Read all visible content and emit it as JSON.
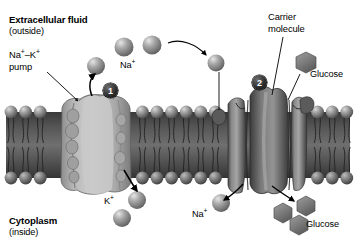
{
  "figure": {
    "type": "cell-membrane-transport-diagram",
    "background_color": "#ffffff",
    "palette": {
      "membrane_dark": "#3f3f3f",
      "membrane_mid": "#6e6e6e",
      "protein_light": "#b9b9b9",
      "protein_dark": "#6a6a6a",
      "sphere": "#8e8e8e",
      "glucose": "#7d7d7d",
      "text": "#000000",
      "badge": "#1a1a1a"
    }
  },
  "labels": {
    "extracellular_fluid": "Extracellular fluid",
    "extracellular_sub": "(outside)",
    "pump_line1": "Na⁻–K⁻ pump",
    "pump_name": "Na",
    "pump_sup1": "+",
    "pump_dash": "–K",
    "pump_sup2": "+",
    "pump_word": "pump",
    "na_top": "Na",
    "na_top_sup": "+",
    "carrier_line1": "Carrier",
    "carrier_line2": "molecule",
    "glucose_top": "Glucose",
    "k_bottom": "K",
    "k_bottom_sup": "+",
    "na_bottom": "Na",
    "na_bottom_sup": "+",
    "glucose_bottom": "Glucose",
    "cytoplasm": "Cytoplasm",
    "cytoplasm_sub": "(inside)"
  },
  "callouts": [
    {
      "number": "1",
      "name": "sodium-potassium-pump-callout"
    },
    {
      "number": "2",
      "name": "carrier-molecule-callout"
    }
  ],
  "particles": {
    "sodium_outside_top": 3,
    "sodium_outside_right": 1,
    "potassium_inside": 2,
    "sodium_inside": 1,
    "glucose_outside": 1,
    "glucose_inside": 3
  },
  "arrows": [
    {
      "name": "pump-leader-arrow",
      "description": "leader line from Na+-K+ pump label to pump protein"
    },
    {
      "name": "sodium-out-arrow",
      "description": "arrow showing Na+ moving out of cell through pump"
    },
    {
      "name": "sodium-transit-arrow",
      "description": "curved arrow of Na+ travelling across the outside toward carrier"
    },
    {
      "name": "potassium-in-arrow",
      "description": "arrow showing K+ moving into cytoplasm through pump"
    },
    {
      "name": "carrier-leader-arrow",
      "description": "leader line from Carrier molecule label to carrier protein"
    },
    {
      "name": "glucose-leader-arrow",
      "description": "leader line from Glucose label to carrier protein"
    },
    {
      "name": "sodium-in-carrier-arrow",
      "description": "arrow showing Na+ entering cytoplasm via carrier"
    },
    {
      "name": "glucose-in-carrier-arrow",
      "description": "arrow showing glucose entering cytoplasm via carrier"
    }
  ]
}
